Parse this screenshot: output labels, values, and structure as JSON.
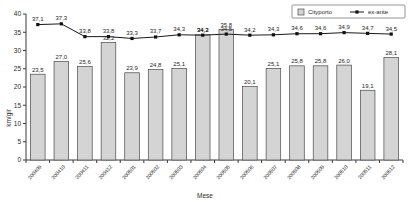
{
  "chart_data": {
    "type": "bar",
    "title": "",
    "xlabel": "Mese",
    "ylabel": "km/gir",
    "ylim": [
      0,
      40
    ],
    "yticks": [
      0,
      5,
      10,
      15,
      20,
      25,
      30,
      35,
      40
    ],
    "grid": false,
    "legend_position": "top-right",
    "categories": [
      "200409",
      "200410",
      "200411",
      "200412",
      "200501",
      "200502",
      "200503",
      "200504",
      "200505",
      "200506",
      "200507",
      "200508",
      "200509",
      "200510",
      "200511",
      "200512"
    ],
    "series": [
      {
        "name": "Cityporto",
        "kind": "bar",
        "values": [
          23.5,
          27.0,
          25.6,
          32.2,
          23.9,
          24.8,
          25.1,
          34.3,
          35.8,
          20.1,
          25.1,
          25.8,
          25.8,
          26.0,
          19.1,
          28.1
        ],
        "labels": [
          "23,5",
          "27,0",
          "25,6",
          "32,2",
          "23,9",
          "24,8",
          "25,1",
          "34,3",
          "35,8",
          "20,1",
          "25,1",
          "25,8",
          "25,8",
          "26,0",
          "19,1",
          "28,1"
        ],
        "color": "#d4d4d4"
      },
      {
        "name": "ex-ante",
        "kind": "line",
        "values": [
          37.1,
          37.3,
          33.8,
          33.8,
          33.3,
          33.7,
          34.3,
          34.2,
          34.5,
          34.2,
          34.3,
          34.6,
          34.6,
          34.9,
          34.7,
          34.5
        ],
        "labels": [
          "37,1",
          "37,3",
          "33,8",
          "33,8",
          "33,3",
          "33,7",
          "34,3",
          "34,2",
          "34,5",
          "34,2",
          "34,3",
          "34,6",
          "34,6",
          "34,9",
          "34,7",
          "34,5"
        ],
        "color": "#111111"
      }
    ]
  },
  "legend": {
    "items": [
      {
        "label": "Cityporto",
        "type": "bar"
      },
      {
        "label": "ex-ante",
        "type": "line"
      }
    ]
  }
}
